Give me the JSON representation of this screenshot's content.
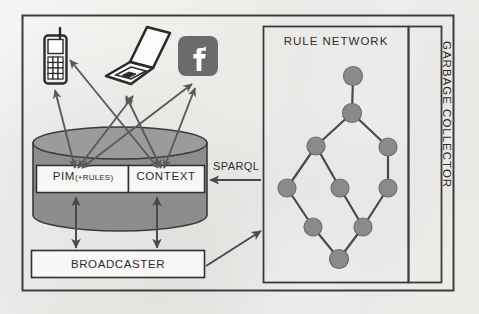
{
  "figure": {
    "type": "architecture-diagram",
    "title_visible": false
  },
  "labels": {
    "pim": "PIM",
    "pim_suffix": "(+RULES)",
    "context": "CONTEXT",
    "broadcaster": "BROADCASTER",
    "sparql": "SPARQL",
    "rule_network": "RULE NETWORK",
    "garbage_collector": "GARBAGE COLLECTOR"
  },
  "devices": [
    {
      "id": "mobile-phone",
      "icon": "mobile-phone-icon"
    },
    {
      "id": "laptop",
      "icon": "laptop-icon"
    },
    {
      "id": "facebook",
      "icon": "facebook-icon"
    }
  ],
  "colors": {
    "cylinder_fill": "#8d8d8d",
    "cylinder_top": "#9a9a9a",
    "cylinder_stroke": "#3a3a3a",
    "node_fill": "#8a8a8a",
    "node_stroke": "#6f6f6f",
    "edge_stroke": "#4a4a4a",
    "arrow_stroke": "#5a5a5a",
    "frame_stroke": "#3c3c3c",
    "box_fill": "#f7f6f4",
    "text": "#2c2c2c",
    "facebook_fill": "#6b6b6b",
    "background": "#f2f1ef"
  },
  "graph": {
    "description": "rule network node graph",
    "nodes": [
      {
        "id": "n1",
        "x": 353,
        "y": 76,
        "r": 9.5
      },
      {
        "id": "n2",
        "x": 352,
        "y": 113,
        "r": 9.5
      },
      {
        "id": "n3",
        "x": 316,
        "y": 146,
        "r": 9.0
      },
      {
        "id": "n4",
        "x": 388,
        "y": 147,
        "r": 9.0
      },
      {
        "id": "n5",
        "x": 287,
        "y": 188,
        "r": 9.0
      },
      {
        "id": "n6",
        "x": 340,
        "y": 188,
        "r": 9.0
      },
      {
        "id": "n7",
        "x": 388,
        "y": 188,
        "r": 9.0
      },
      {
        "id": "n8",
        "x": 313,
        "y": 227,
        "r": 9.0
      },
      {
        "id": "n9",
        "x": 363,
        "y": 227,
        "r": 9.0
      },
      {
        "id": "n10",
        "x": 339,
        "y": 259,
        "r": 9.5
      }
    ],
    "edges": [
      [
        "n1",
        "n2"
      ],
      [
        "n2",
        "n3"
      ],
      [
        "n2",
        "n4"
      ],
      [
        "n3",
        "n5"
      ],
      [
        "n3",
        "n6"
      ],
      [
        "n4",
        "n7"
      ],
      [
        "n5",
        "n8"
      ],
      [
        "n6",
        "n9"
      ],
      [
        "n7",
        "n9"
      ],
      [
        "n8",
        "n10"
      ],
      [
        "n9",
        "n10"
      ]
    ]
  },
  "connections": [
    {
      "from": "pim",
      "to": "mobile-phone",
      "style": "double-arrow"
    },
    {
      "from": "pim",
      "to": "laptop",
      "style": "double-arrow"
    },
    {
      "from": "pim",
      "to": "facebook",
      "style": "double-arrow"
    },
    {
      "from": "context",
      "to": "mobile-phone",
      "style": "double-arrow"
    },
    {
      "from": "context",
      "to": "laptop",
      "style": "double-arrow"
    },
    {
      "from": "context",
      "to": "facebook",
      "style": "double-arrow"
    },
    {
      "from": "rule-network",
      "to": "context",
      "label": "SPARQL",
      "style": "single-arrow"
    },
    {
      "from": "broadcaster",
      "to": "rule-network",
      "style": "single-arrow"
    },
    {
      "from": "pim",
      "to": "broadcaster",
      "style": "double-arrow"
    },
    {
      "from": "context",
      "to": "broadcaster",
      "style": "double-arrow"
    }
  ]
}
